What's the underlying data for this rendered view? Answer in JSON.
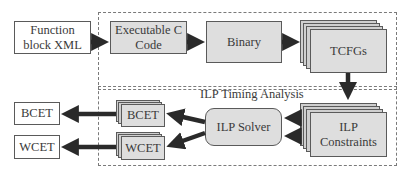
{
  "diagram": {
    "input": {
      "label_line1": "Function",
      "label_line2": "block XML"
    },
    "compile_stage": {
      "executable": {
        "label_line1": "Executable C",
        "label_line2": "Code"
      },
      "binary": {
        "label": "Binary"
      },
      "tcfgs": {
        "label": "TCFGs"
      }
    },
    "analysis_stage": {
      "title": "ILP Timing Analysis",
      "constraints": {
        "label_line1": "ILP",
        "label_line2": "Constraints"
      },
      "solver": {
        "label": "ILP Solver"
      },
      "bcet_stack": {
        "label": "BCET"
      },
      "wcet_stack": {
        "label": "WCET"
      }
    },
    "outputs": {
      "bcet": {
        "label": "BCET"
      },
      "wcet": {
        "label": "WCET"
      }
    },
    "colors": {
      "arrow": "#2a2a2a",
      "box_fill_gray": "#dedede",
      "box_border": "#5a5a5a",
      "dashed_border": "#7a7a7a"
    }
  }
}
